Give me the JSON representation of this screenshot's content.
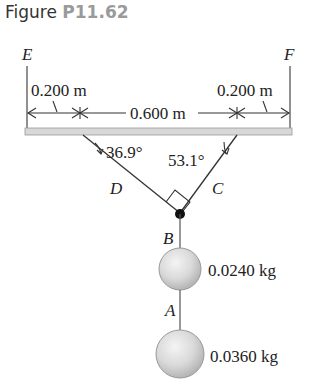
{
  "figure": {
    "title_prefix": "Figure",
    "title_number": "P11.62"
  },
  "labels": {
    "support_left": "E",
    "support_right": "F",
    "rod_left": "D",
    "rod_right": "C",
    "junction": "B",
    "string_lower": "A"
  },
  "dimensions": {
    "left_offset": "0.200 m",
    "middle_span": "0.600 m",
    "right_offset": "0.200 m"
  },
  "angles": {
    "left": "36.9°",
    "right": "53.1°"
  },
  "masses": {
    "upper": "0.0240 kg",
    "lower": "0.0360 kg"
  },
  "colors": {
    "line": "#333333",
    "bar_fill": "#d8d8d8",
    "title_number": "#9a9a9a"
  }
}
